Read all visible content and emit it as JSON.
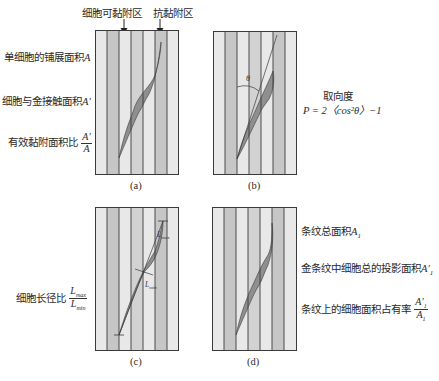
{
  "top_labels": {
    "adhesive_zone": "细胞可黏附区",
    "anti_adhesive_zone": "抗黏附区"
  },
  "panels": [
    {
      "id": "a",
      "caption": "(a)"
    },
    {
      "id": "b",
      "caption": "(b)"
    },
    {
      "id": "c",
      "caption": "(c)"
    },
    {
      "id": "d",
      "caption": "(d)"
    }
  ],
  "left_labels_a": {
    "spread_area": "单细胞的铺展面积",
    "spread_area_sym": "A",
    "contact_area": "细胞与金接触面积",
    "contact_area_sym": "A′",
    "effective_ratio": "有效黏附面积比",
    "ratio_num": "A′",
    "ratio_den": "A"
  },
  "right_labels_b": {
    "orientation_title": "取向度",
    "orientation_formula": "P = 2〈cos²θ〉−1",
    "angle_symbol": "θ"
  },
  "left_labels_c": {
    "aspect_ratio": "细胞长径比",
    "ratio_num": "L",
    "ratio_num_sub": "max",
    "ratio_den": "L",
    "ratio_den_sub": "min",
    "lmax_label": "L",
    "lmax_sub": "max",
    "lmin_label": "L",
    "lmin_sub": "min"
  },
  "right_labels_d": {
    "stripe_total_area": "条纹总面积",
    "stripe_total_sym": "A",
    "stripe_total_sub": "1",
    "projected_area": "金条纹中细胞总的投影面积",
    "projected_sym": "A′",
    "projected_sub": "1",
    "occupancy_ratio": "条纹上的细胞面积占有率",
    "occ_num": "A′",
    "occ_num_sub": "1",
    "occ_den": "A",
    "occ_den_sub": "1"
  },
  "colors": {
    "stripe_light": "#e8e8e8",
    "stripe_dark": "#c6c6c6",
    "stripe_mid": "#d2d2d2",
    "cell_fill": "#8f8f8f",
    "line": "#3a3a3a"
  }
}
